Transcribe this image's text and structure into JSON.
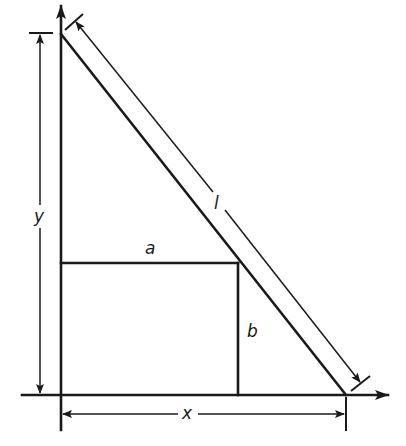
{
  "diagram": {
    "labels": {
      "ladder_length": "l",
      "box_width": "a",
      "box_height": "b",
      "wall_height": "y",
      "ground_distance": "x"
    },
    "colors": {
      "ink": "#1a1a1a",
      "background": "#ffffff"
    }
  }
}
